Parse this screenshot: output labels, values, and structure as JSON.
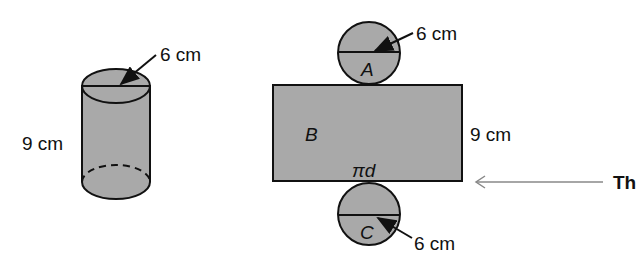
{
  "cylinder": {
    "diameter_label": "6 cm",
    "height_label": "9 cm"
  },
  "net": {
    "top_circle_label": "A",
    "top_circle_diameter": "6 cm",
    "rectangle_label": "B",
    "rectangle_height": "9 cm",
    "rectangle_width_label": "πd",
    "bottom_circle_label": "C",
    "bottom_circle_diameter": "6 cm"
  },
  "callout": {
    "text": "Th"
  },
  "colors": {
    "shape_fill": "#a9a9a9",
    "stroke": "#111111",
    "callout_arrow": "#888888"
  }
}
